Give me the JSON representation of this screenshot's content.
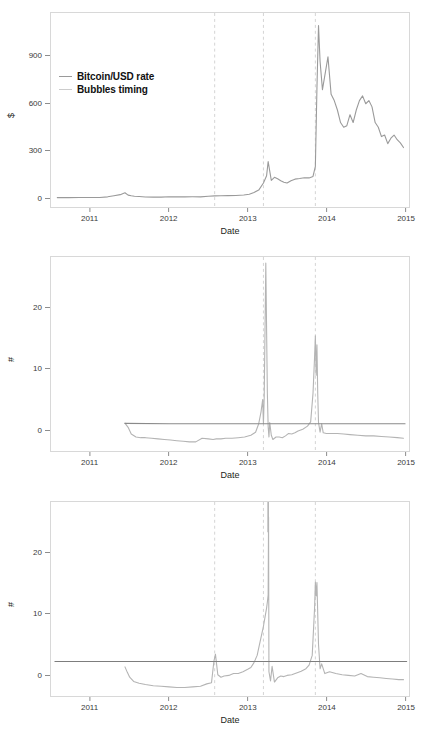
{
  "figure": {
    "panel_count": 3,
    "colors": {
      "series_line": "#9a9a9a",
      "critical_line": "#8a8a8a",
      "bubble_line": "#c8c8c8",
      "frame": "#d8d8d8",
      "text": "#231f20"
    }
  },
  "chart_data": [
    {
      "type": "line",
      "title": "",
      "xlabel": "Date",
      "ylabel": "$",
      "xlim": [
        2010.5,
        2015.05
      ],
      "ylim": [
        -60,
        1180
      ],
      "xticks": [
        2011,
        2012,
        2013,
        2014,
        2015
      ],
      "xticklabels": [
        "2011",
        "2012",
        "2013",
        "2014",
        "2015"
      ],
      "yticks": [
        0,
        300,
        600,
        900
      ],
      "yticklabels": [
        "0",
        "300",
        "600",
        "900"
      ],
      "grid": false,
      "legend_position": "upper left",
      "legend": [
        {
          "label": "Bitcoin/USD rate",
          "color": "#9a9a9a"
        },
        {
          "label": "Bubbles timing",
          "color": "#cccccc"
        }
      ],
      "annotations": {
        "bubble_dates": [
          2012.58,
          2013.2,
          2013.86
        ]
      },
      "series": [
        {
          "name": "Bitcoin/USD rate",
          "color": "#9a9a9a",
          "x": [
            2010.58,
            2010.72,
            2010.86,
            2011.0,
            2011.12,
            2011.22,
            2011.3,
            2011.38,
            2011.44,
            2011.48,
            2011.52,
            2011.56,
            2011.62,
            2011.7,
            2011.8,
            2011.9,
            2012.0,
            2012.1,
            2012.2,
            2012.3,
            2012.4,
            2012.5,
            2012.58,
            2012.66,
            2012.75,
            2012.85,
            2012.95,
            2013.02,
            2013.08,
            2013.14,
            2013.2,
            2013.24,
            2013.26,
            2013.3,
            2013.34,
            2013.38,
            2013.42,
            2013.46,
            2013.5,
            2013.55,
            2013.6,
            2013.66,
            2013.72,
            2013.78,
            2013.83,
            2013.86,
            2013.88,
            2013.9,
            2013.92,
            2013.95,
            2013.98,
            2014.02,
            2014.06,
            2014.1,
            2014.14,
            2014.18,
            2014.22,
            2014.26,
            2014.3,
            2014.34,
            2014.38,
            2014.42,
            2014.46,
            2014.5,
            2014.54,
            2014.58,
            2014.62,
            2014.66,
            2014.7,
            2014.74,
            2014.78,
            2014.82,
            2014.86,
            2014.9,
            2014.94,
            2014.98
          ],
          "y": [
            0.06,
            0.1,
            0.25,
            0.4,
            1.0,
            5.0,
            12.0,
            19.0,
            31.0,
            16.0,
            12.0,
            9.0,
            7.0,
            4.0,
            3.0,
            3.2,
            5.5,
            5.0,
            5.0,
            5.2,
            5.0,
            8.5,
            11.0,
            12.0,
            12.5,
            13.5,
            17.0,
            22.0,
            33.0,
            48.0,
            93.0,
            140.0,
            230.0,
            110.0,
            130.0,
            120.0,
            108.0,
            98.0,
            93.0,
            108.0,
            118.0,
            122.0,
            127.0,
            126.0,
            135.0,
            200.0,
            700.0,
            1100.0,
            870.0,
            690.0,
            780.0,
            900.0,
            660.0,
            620.0,
            560.0,
            480.0,
            450.0,
            460.0,
            530.0,
            480.0,
            560.0,
            620.0,
            650.0,
            600.0,
            620.0,
            580.0,
            480.0,
            450.0,
            390.0,
            400.0,
            345.0,
            380.0,
            400.0,
            370.0,
            350.0,
            320.0
          ]
        }
      ]
    },
    {
      "type": "line",
      "title": "",
      "xlabel": "Date",
      "ylabel": "#",
      "xlim": [
        2010.5,
        2015.05
      ],
      "ylim": [
        -3.5,
        28.5
      ],
      "xticks": [
        2011,
        2012,
        2013,
        2014,
        2015
      ],
      "xticklabels": [
        "2011",
        "2012",
        "2013",
        "2014",
        "2015"
      ],
      "yticks": [
        0,
        10,
        20
      ],
      "yticklabels": [
        "0",
        "10",
        "20"
      ],
      "grid": false,
      "legend_position": "upper left",
      "legend": [
        {
          "label": "95% test critical value",
          "color": "#8a8a8a"
        },
        {
          "label": "Bubbles timing",
          "color": "#bdbdbd"
        },
        {
          "label": "Sup ADF test statistic",
          "color": "#c4c4c4"
        }
      ],
      "annotations": {
        "bubble_dates": [
          2013.2,
          2013.86
        ],
        "critical_value": 1.0
      },
      "series": [
        {
          "name": "Sup ADF test statistic",
          "color": "#b4b4b4",
          "x": [
            2011.44,
            2011.48,
            2011.52,
            2011.58,
            2011.64,
            2011.7,
            2011.78,
            2011.86,
            2011.94,
            2012.02,
            2012.1,
            2012.18,
            2012.26,
            2012.34,
            2012.42,
            2012.5,
            2012.56,
            2012.6,
            2012.66,
            2012.72,
            2012.8,
            2012.88,
            2012.96,
            2013.04,
            2013.1,
            2013.14,
            2013.17,
            2013.19,
            2013.2,
            2013.21,
            2013.23,
            2013.25,
            2013.26,
            2013.27,
            2013.28,
            2013.3,
            2013.32,
            2013.34,
            2013.36,
            2013.4,
            2013.44,
            2013.48,
            2013.52,
            2013.56,
            2013.6,
            2013.64,
            2013.7,
            2013.76,
            2013.8,
            2013.83,
            2013.85,
            2013.86,
            2013.87,
            2013.88,
            2013.89,
            2013.9,
            2013.92,
            2013.94,
            2013.96,
            2014.0,
            2014.06,
            2014.14,
            2014.22,
            2014.3,
            2014.4,
            2014.5,
            2014.6,
            2014.7,
            2014.8,
            2014.9,
            2014.98
          ],
          "y": [
            1.1,
            0.4,
            -0.7,
            -1.2,
            -1.3,
            -1.3,
            -1.4,
            -1.5,
            -1.6,
            -1.7,
            -1.8,
            -1.9,
            -2.0,
            -2.0,
            -1.4,
            -1.5,
            -1.6,
            -1.5,
            -1.5,
            -1.4,
            -1.4,
            -1.3,
            -1.2,
            -0.9,
            -0.4,
            1.0,
            3.0,
            5.0,
            1.0,
            5.5,
            27.5,
            6.0,
            0.5,
            -1.2,
            1.2,
            -0.9,
            -1.6,
            -1.4,
            -1.2,
            -1.2,
            -1.3,
            -1.0,
            -0.6,
            -0.7,
            -0.5,
            -0.2,
            0.1,
            0.6,
            1.3,
            6.0,
            12.0,
            15.5,
            9.0,
            14.0,
            6.0,
            1.2,
            -0.4,
            1.0,
            -0.5,
            -0.6,
            -0.6,
            -0.6,
            -0.7,
            -0.8,
            -0.9,
            -1.0,
            -1.0,
            -1.1,
            -1.2,
            -1.3,
            -1.4
          ]
        },
        {
          "name": "95% test critical value",
          "color": "#8a8a8a",
          "x": [
            2011.44,
            2012.0,
            2013.0,
            2014.0,
            2015.0
          ],
          "y": [
            1.05,
            1.0,
            1.0,
            1.0,
            1.0
          ]
        }
      ]
    },
    {
      "type": "line",
      "title": "",
      "xlabel": "Date",
      "ylabel": "#",
      "xlim": [
        2010.5,
        2015.05
      ],
      "ylim": [
        -3.5,
        28.5
      ],
      "xticks": [
        2011,
        2012,
        2013,
        2014,
        2015
      ],
      "xticklabels": [
        "2011",
        "2012",
        "2013",
        "2014",
        "2015"
      ],
      "yticks": [
        0,
        10,
        20
      ],
      "yticklabels": [
        "0",
        "10",
        "20"
      ],
      "grid": false,
      "legend_position": "upper left",
      "legend": [
        {
          "label": "95% critical value",
          "color": "#8a8a8a"
        },
        {
          "label": "Bubbles timing",
          "color": "#bdbdbd"
        },
        {
          "label": "Generalized sup ADF test statistic",
          "color": "#c4c4c4"
        }
      ],
      "annotations": {
        "bubble_dates": [
          2012.58,
          2013.2,
          2013.86
        ],
        "critical_value": 2.2,
        "clipped_spike_date": 2013.26
      },
      "series": [
        {
          "name": "Generalized sup ADF test statistic",
          "color": "#b4b4b4",
          "x": [
            2011.44,
            2011.47,
            2011.5,
            2011.55,
            2011.62,
            2011.7,
            2011.8,
            2011.9,
            2012.0,
            2012.1,
            2012.2,
            2012.3,
            2012.4,
            2012.48,
            2012.54,
            2012.57,
            2012.59,
            2012.62,
            2012.66,
            2012.7,
            2012.76,
            2012.82,
            2012.88,
            2012.94,
            2013.0,
            2013.04,
            2013.08,
            2013.12,
            2013.15,
            2013.18,
            2013.2,
            2013.22,
            2013.24,
            2013.25,
            2013.26,
            2013.265,
            2013.27,
            2013.29,
            2013.31,
            2013.34,
            2013.38,
            2013.42,
            2013.46,
            2013.5,
            2013.56,
            2013.62,
            2013.68,
            2013.74,
            2013.78,
            2013.82,
            2013.85,
            2013.86,
            2013.87,
            2013.88,
            2013.9,
            2013.92,
            2013.94,
            2013.98,
            2014.04,
            2014.12,
            2014.2,
            2014.28,
            2014.36,
            2014.44,
            2014.52,
            2014.6,
            2014.68,
            2014.76,
            2014.84,
            2014.92,
            2014.98
          ],
          "y": [
            1.3,
            0.4,
            -0.4,
            -1.1,
            -1.4,
            -1.6,
            -1.8,
            -1.9,
            -2.0,
            -2.1,
            -2.1,
            -2.0,
            -1.9,
            -1.5,
            -1.3,
            2.2,
            3.4,
            0.0,
            -0.4,
            -0.2,
            -0.1,
            0.2,
            0.2,
            0.5,
            0.9,
            1.2,
            2.0,
            3.2,
            5.0,
            6.8,
            8.0,
            9.5,
            11.0,
            12.0,
            13.2,
            26.0,
            0.5,
            -1.0,
            1.4,
            -1.2,
            -0.5,
            -0.2,
            -0.3,
            -0.1,
            0.0,
            0.3,
            0.6,
            1.0,
            1.6,
            3.2,
            11.0,
            15.3,
            13.0,
            15.2,
            5.0,
            1.0,
            1.8,
            0.2,
            0.5,
            0.2,
            0.0,
            -0.1,
            -0.2,
            0.2,
            -0.3,
            -0.4,
            -0.5,
            -0.6,
            -0.7,
            -0.8,
            -0.8
          ]
        },
        {
          "name": "95% critical value",
          "color": "#7d7d7d",
          "x": [
            2010.55,
            2012.0,
            2013.0,
            2014.0,
            2015.02
          ],
          "y": [
            2.2,
            2.2,
            2.2,
            2.2,
            2.2
          ]
        }
      ]
    }
  ]
}
